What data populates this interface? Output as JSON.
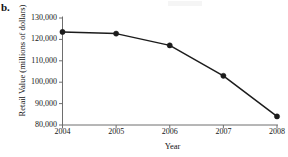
{
  "panel": {
    "label": "b."
  },
  "chart_data": {
    "type": "line",
    "title": "",
    "subtitle": "",
    "xlabel": "Year",
    "ylabel": "Retail Value (millions of dollars)",
    "categories": [
      "2004",
      "2005",
      "2006",
      "2007",
      "2008"
    ],
    "values": [
      123500,
      122700,
      117200,
      103000,
      84000
    ],
    "series": [
      {
        "name": "Retail Value",
        "values": [
          123500,
          122700,
          117200,
          103000,
          84000
        ]
      }
    ],
    "ylim": [
      80000,
      130000
    ],
    "ytick_labels": [
      "130,000",
      "120,000",
      "110,000",
      "100,000",
      "90,000",
      "80,000"
    ],
    "ytick_values": [
      130000,
      120000,
      110000,
      100000,
      90000,
      80000
    ],
    "xtick_labels": [
      "2004",
      "2005",
      "2006",
      "2007",
      "2008"
    ],
    "grid": false,
    "legend": false,
    "legend_position": "none",
    "line_color": "#1c1c1c",
    "marker_color": "#1c1c1c",
    "marker_shape": "circle",
    "axis_color": "#6e6e6e"
  }
}
